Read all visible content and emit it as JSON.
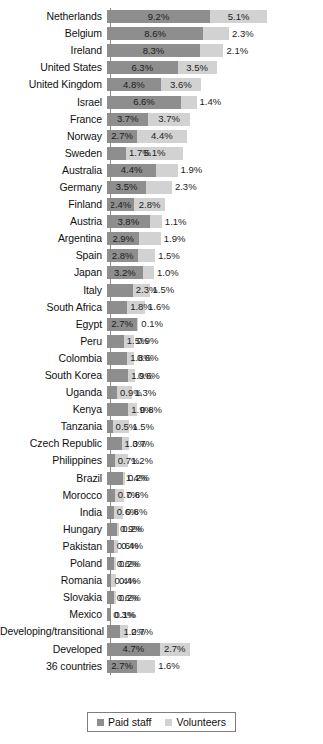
{
  "chart_data": {
    "type": "bar",
    "orientation": "horizontal",
    "stacked": true,
    "title": "",
    "subtitle": "",
    "xlabel": "",
    "ylabel": "",
    "grid": false,
    "xlim": [
      0,
      19
    ],
    "legend_position": "bottom",
    "value_suffix": "%",
    "categories": [
      "Netherlands",
      "Belgium",
      "Ireland",
      "United States",
      "United Kingdom",
      "Israel",
      "France",
      "Norway",
      "Sweden",
      "Australia",
      "Germany",
      "Finland",
      "Austria",
      "Argentina",
      "Spain",
      "Japan",
      "Italy",
      "South Africa",
      "Egypt",
      "Peru",
      "Colombia",
      "South Korea",
      "Uganda",
      "Kenya",
      "Tanzania",
      "Czech Republic",
      "Philippines",
      "Brazil",
      "Morocco",
      "India",
      "Hungary",
      "Pakistan",
      "Poland",
      "Romania",
      "Slovakia",
      "Mexico",
      "Developing/transitional",
      "Developed",
      "36 countries"
    ],
    "series": [
      {
        "name": "Paid staff",
        "color": "#8e8e8e",
        "values": [
          9.2,
          8.6,
          8.3,
          6.3,
          4.8,
          6.6,
          3.7,
          2.7,
          1.7,
          4.4,
          3.5,
          2.4,
          3.8,
          2.9,
          2.8,
          3.2,
          2.3,
          1.8,
          2.7,
          1.5,
          1.8,
          1.9,
          0.9,
          1.9,
          0.5,
          1.3,
          0.7,
          1.4,
          0.7,
          0.6,
          0.9,
          0.6,
          0.6,
          0.4,
          0.6,
          0.3,
          1.2,
          4.7,
          2.7
        ],
        "labels": [
          "9.2%",
          "8.6%",
          "8.3%",
          "6.3%",
          "4.8%",
          "6.6%",
          "3.7%",
          "2.7%",
          "1.7%",
          "4.4%",
          "3.5%",
          "2.4%",
          "3.8%",
          "2.9%",
          "2.8%",
          "3.2%",
          "2.3%",
          "1.8%",
          "2.7%",
          "1.5%",
          "1.8%",
          "1.9%",
          "0.9%",
          "1.9%",
          "0.5%",
          "1.3%",
          "0.7%",
          "1.4%",
          "0.7%",
          "0.6%",
          "0.9%",
          "0.6%",
          "0.6%",
          "0.4%",
          "0.6%",
          "0.3%",
          "1.2%",
          "4.7%",
          "2.7%"
        ]
      },
      {
        "name": "Volunteers",
        "color": "#d2d2d2",
        "values": [
          5.1,
          2.3,
          2.1,
          3.5,
          3.6,
          1.4,
          3.7,
          4.4,
          5.1,
          1.9,
          2.3,
          2.8,
          1.1,
          1.9,
          1.5,
          1.0,
          1.5,
          1.6,
          0.1,
          0.9,
          0.6,
          0.6,
          1.3,
          0.8,
          1.5,
          0.7,
          1.2,
          0.2,
          0.8,
          0.8,
          0.2,
          0.4,
          0.2,
          0.4,
          0.2,
          0.1,
          0.7,
          2.7,
          1.6
        ],
        "labels": [
          "5.1%",
          "2.3%",
          "2.1%",
          "3.5%",
          "3.6%",
          "1.4%",
          "3.7%",
          "4.4%",
          "5.1%",
          "1.9%",
          "2.3%",
          "2.8%",
          "1.1%",
          "1.9%",
          "1.5%",
          "1.0%",
          "1.5%",
          "1.6%",
          "0.1%",
          "0.9%",
          "0.6%",
          "0.6%",
          "1.3%",
          "0.8%",
          "1.5%",
          "0.7%",
          "1.2%",
          "0.2%",
          "0.8%",
          "0.8%",
          "0.2%",
          "0.4%",
          "0.2%",
          "0.4%",
          "0.2%",
          "0.1%",
          "0.7%",
          "2.7%",
          "1.6%"
        ]
      }
    ]
  },
  "legend": {
    "items": [
      {
        "label": "Paid staff",
        "color": "#8e8e8e"
      },
      {
        "label": "Volunteers",
        "color": "#d2d2d2"
      }
    ]
  },
  "style": {
    "paid_color": "#8e8e8e",
    "volunteer_color": "#d2d2d2",
    "axis_color": "#8a8a8a",
    "text_color": "#111111",
    "background": "#ffffff",
    "px_per_percent": 11.2
  }
}
